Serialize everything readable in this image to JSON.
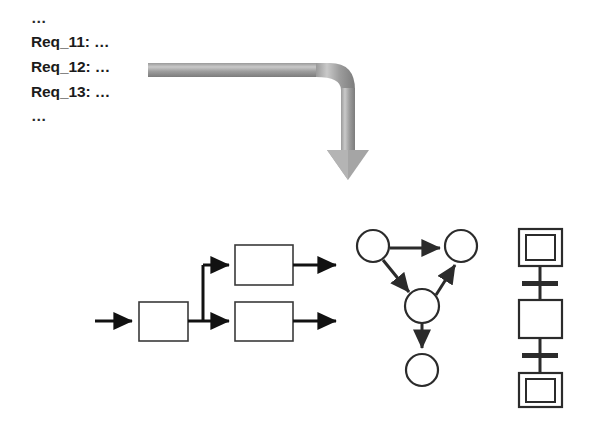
{
  "page": {
    "background_color": "#ffffff",
    "width": 596,
    "height": 437
  },
  "requirements": {
    "name": "requirements-list",
    "lines": [
      {
        "text": "…"
      },
      {
        "text": "Req_11: …"
      },
      {
        "text": "Req_12: …"
      },
      {
        "text": "Req_13: …"
      },
      {
        "text": "…"
      }
    ],
    "text_color": "#1b1b1b"
  },
  "transform_arrow": {
    "name": "elbow-arrow-down",
    "label": "",
    "color_light": "#b3b3b3",
    "color_dark": "#6e6e6e",
    "direction": "right-then-down"
  },
  "models": {
    "flowchart": {
      "name": "flowchart-diagram",
      "stroke": "#3a3a3a",
      "arrow_color": "#111111",
      "fill": "#ffffff",
      "boxes": [
        {
          "id": "box-input",
          "label": ""
        },
        {
          "id": "box-upper",
          "label": ""
        },
        {
          "id": "box-lower",
          "label": ""
        }
      ],
      "edges": [
        {
          "from": "entry",
          "to": "box-input"
        },
        {
          "from": "box-input",
          "to": "box-upper"
        },
        {
          "from": "box-input",
          "to": "box-lower"
        },
        {
          "from": "box-upper",
          "to": "exit-upper"
        },
        {
          "from": "box-lower",
          "to": "exit-lower"
        }
      ]
    },
    "graph": {
      "name": "directed-graph-diagram",
      "stroke": "#2b2b2b",
      "fill": "#ffffff",
      "nodes": [
        {
          "id": "node-top-left",
          "label": ""
        },
        {
          "id": "node-top-right",
          "label": ""
        },
        {
          "id": "node-middle",
          "label": ""
        },
        {
          "id": "node-bottom",
          "label": ""
        }
      ],
      "edges": [
        {
          "from": "node-top-left",
          "to": "node-top-right"
        },
        {
          "from": "node-top-left",
          "to": "node-middle"
        },
        {
          "from": "node-middle",
          "to": "node-top-right"
        },
        {
          "from": "node-middle",
          "to": "node-bottom"
        }
      ]
    },
    "activity": {
      "name": "activity-net-diagram",
      "stroke": "#2b2b2b",
      "fill": "#ffffff",
      "elements": [
        {
          "id": "place-start",
          "type": "double-square",
          "label": ""
        },
        {
          "id": "transition-upper",
          "type": "bar",
          "label": ""
        },
        {
          "id": "action-middle",
          "type": "square",
          "label": ""
        },
        {
          "id": "transition-lower",
          "type": "bar",
          "label": ""
        },
        {
          "id": "place-end",
          "type": "double-square",
          "label": ""
        }
      ]
    }
  }
}
